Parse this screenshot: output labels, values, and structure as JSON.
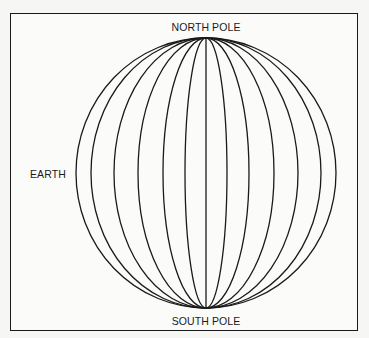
{
  "diagram": {
    "labels": {
      "north_pole": "NORTH POLE",
      "south_pole": "SOUTH POLE",
      "earth": "EARTH"
    },
    "globe": {
      "center_x": 206,
      "center_y": 173,
      "radius_y": 135,
      "meridian_radii_x": [
        130,
        115,
        92,
        68,
        43,
        21,
        0
      ],
      "meridian_count": 13,
      "stroke_color": "#1a1a1a"
    },
    "frame": {
      "border_color": "#1a1a1a",
      "background": "#fbfbfa"
    }
  }
}
